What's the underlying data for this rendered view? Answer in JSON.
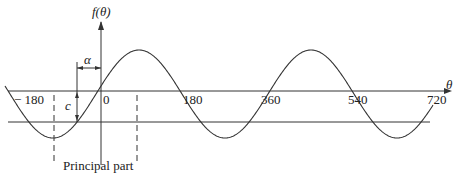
{
  "diagram": {
    "y_axis_label": "f(θ)",
    "x_axis_label": "θ",
    "tick_labels": [
      "− 180",
      "0",
      "180",
      "360",
      "540",
      "720"
    ],
    "alpha_label": "α",
    "c_label": "c",
    "principal_part_label": "Principal part",
    "colors": {
      "line": "#333333",
      "background": "#ffffff"
    }
  }
}
